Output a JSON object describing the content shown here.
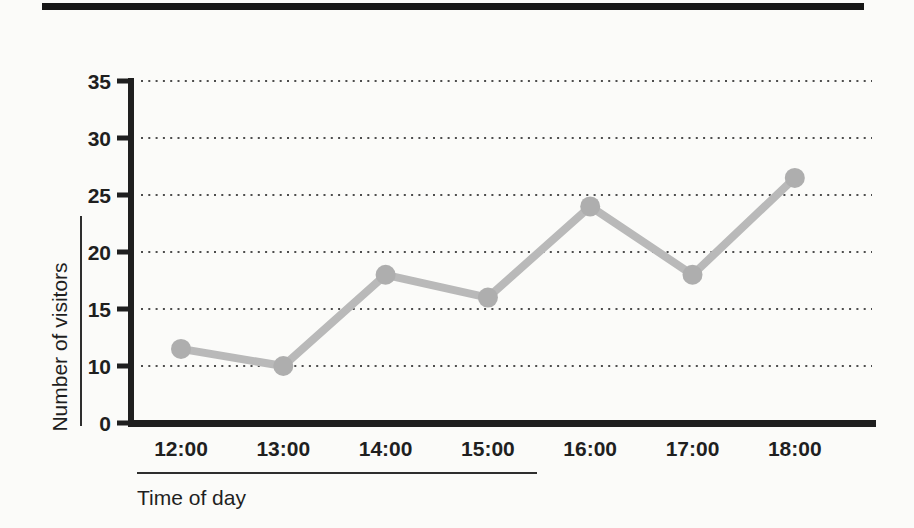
{
  "page": {
    "background_color": "#fbfbf9",
    "ink_color": "#1f1f1f",
    "rule_color": "#2e2e2e",
    "top_rule_color": "#161616"
  },
  "chart_data": {
    "type": "line",
    "title": "",
    "xlabel": "Time of day",
    "ylabel": "Number of visitors",
    "categories": [
      "12:00",
      "13:00",
      "14:00",
      "15:00",
      "16:00",
      "17:00",
      "18:00"
    ],
    "series": [
      {
        "name": "Number of visitors",
        "values": [
          11.5,
          10,
          18,
          16,
          24,
          18,
          26.5
        ]
      }
    ],
    "y_ticks": [
      0,
      10,
      15,
      20,
      25,
      30,
      35
    ],
    "y_axis_scale_note": "ticks evenly spaced on axis; the 0-10 span is compressed into a single step (no 5 tick shown)",
    "grid": "horizontal dotted gridlines at y ticks 10,15,20,25,30,35; none at 0",
    "legend_position": "none",
    "line_color": "#b9b9b9",
    "marker_color": "#aeaeae",
    "gridline_color": "#4d4d4d"
  }
}
